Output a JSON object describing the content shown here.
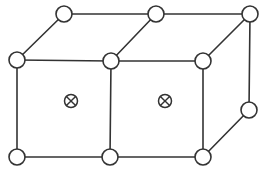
{
  "diagram": {
    "title": "",
    "colors": {
      "stroke": "#333333",
      "node_fill": "#ffffff",
      "background": "#ffffff"
    },
    "nodes": [
      {
        "id": "front-top-left",
        "kind": "lattice-site"
      },
      {
        "id": "front-top-middle",
        "kind": "lattice-site"
      },
      {
        "id": "front-top-right",
        "kind": "lattice-site"
      },
      {
        "id": "front-bottom-left",
        "kind": "lattice-site"
      },
      {
        "id": "front-bottom-middle",
        "kind": "lattice-site"
      },
      {
        "id": "front-bottom-right",
        "kind": "lattice-site"
      },
      {
        "id": "back-top-left",
        "kind": "lattice-site"
      },
      {
        "id": "back-top-middle",
        "kind": "lattice-site"
      },
      {
        "id": "back-top-right",
        "kind": "lattice-site"
      },
      {
        "id": "back-bottom-right",
        "kind": "lattice-site"
      }
    ],
    "edges": [
      [
        "front-top-left",
        "front-top-middle"
      ],
      [
        "front-top-middle",
        "front-top-right"
      ],
      [
        "front-bottom-left",
        "front-bottom-middle"
      ],
      [
        "front-bottom-middle",
        "front-bottom-right"
      ],
      [
        "front-top-left",
        "front-bottom-left"
      ],
      [
        "front-top-middle",
        "front-bottom-middle"
      ],
      [
        "front-top-right",
        "front-bottom-right"
      ],
      [
        "back-top-left",
        "back-top-middle"
      ],
      [
        "back-top-middle",
        "back-top-right"
      ],
      [
        "front-top-left",
        "back-top-left"
      ],
      [
        "front-top-middle",
        "back-top-middle"
      ],
      [
        "front-top-right",
        "back-top-right"
      ],
      [
        "back-top-right",
        "back-bottom-right"
      ],
      [
        "front-bottom-right",
        "back-bottom-right"
      ]
    ],
    "markers": [
      {
        "id": "face-center-left",
        "symbol": "⊗",
        "face": "front-left-cell"
      },
      {
        "id": "face-center-right",
        "symbol": "⊗",
        "face": "front-right-cell"
      }
    ]
  }
}
